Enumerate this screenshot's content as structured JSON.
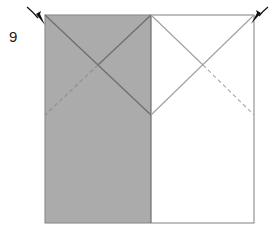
{
  "figure": {
    "kind": "origami-fold-diagram",
    "step_number": "9",
    "caption": "",
    "canvas": {
      "width": 270,
      "height": 235
    },
    "colors": {
      "paper_front_fill": "#ababab",
      "paper_back_fill": "#ffffff",
      "outline": "#8a8a8a",
      "crease_solid": "#6e6e6e",
      "crease_dashed": "#8f8f8f",
      "arrow": "#111111",
      "label_text": "#1a1a1a",
      "page_background": "#ffffff"
    },
    "square": {
      "left": 45,
      "top": 15,
      "right": 254,
      "bottom": 223,
      "middle_x": 151,
      "mid_y": 115
    },
    "regions": [
      {
        "name": "left-half-shaded",
        "fill": "paper_front_fill",
        "label": "shaded left half"
      },
      {
        "name": "right-half-plain",
        "fill": "paper_back_fill",
        "label": "white right half"
      }
    ],
    "creases": [
      {
        "name": "left-valley-down-right",
        "style": "solid",
        "from": [
          45,
          15
        ],
        "to": [
          151,
          115
        ]
      },
      {
        "name": "left-mountain-down-left",
        "style": "solid",
        "from": [
          151,
          15
        ],
        "to": [
          45,
          115
        ]
      },
      {
        "name": "left-hidden-fold",
        "style": "dashed",
        "from": [
          151,
          15
        ],
        "to": [
          45,
          115
        ]
      },
      {
        "name": "right-fold-down-right",
        "style": "solid",
        "from": [
          151,
          15
        ],
        "to": [
          203,
          65
        ]
      },
      {
        "name": "right-hidden-down-right",
        "style": "dashed",
        "from": [
          203,
          65
        ],
        "to": [
          254,
          115
        ]
      },
      {
        "name": "right-fold-down-left",
        "style": "solid",
        "from": [
          254,
          15
        ],
        "to": [
          151,
          115
        ]
      }
    ],
    "edges": [
      {
        "name": "square-outline",
        "style": "solid"
      },
      {
        "name": "center-vertical-divider",
        "style": "solid",
        "from": [
          151,
          15
        ],
        "to": [
          151,
          223
        ]
      }
    ],
    "arrows": [
      {
        "name": "arrow-top-left",
        "points_to": "top-left-corner",
        "from": [
          27,
          7
        ],
        "to": [
          45,
          24
        ]
      },
      {
        "name": "arrow-top-right",
        "points_to": "top-right-corner",
        "from": [
          268,
          7
        ],
        "to": [
          252,
          23
        ]
      }
    ]
  }
}
